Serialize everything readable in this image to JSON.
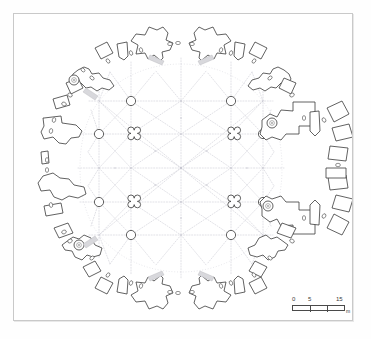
{
  "figure": {
    "type": "architectural-plan",
    "background_color": "#ffffff",
    "frame_color": "#c9c9c9"
  },
  "scale_bar": {
    "name": "scale-bar",
    "ticks": [
      "0",
      "5",
      "15"
    ],
    "unit": "m",
    "tick_positions_m": [
      0,
      5,
      15
    ],
    "bar_length_px": 53
  },
  "plan": {
    "ink_color": "#3a3a3a",
    "rib_color": "#b9b9c4",
    "grid_color": "#c6c6cf",
    "center": {
      "x": 181,
      "y": 168
    },
    "chamber_radius_x": 92,
    "chamber_radius_y": 102,
    "description": "Circular rock-cut hall ringed by radial niche chambers, internal dotted rib-vault pattern, grid of round and quatrefoil piers",
    "piers": {
      "round_label": "round-pier",
      "quatrefoil_label": "quatrefoil-pier",
      "round_positions": [
        [
          131,
          101
        ],
        [
          231,
          101
        ],
        [
          99,
          134
        ],
        [
          263,
          134
        ],
        [
          99,
          202
        ],
        [
          263,
          202
        ],
        [
          131,
          235
        ],
        [
          231,
          235
        ]
      ],
      "quatrefoil_positions": [
        [
          131,
          134
        ],
        [
          231,
          134
        ],
        [
          131,
          202
        ],
        [
          231,
          202
        ]
      ],
      "round_radius": 5,
      "quatrefoil_radius": 7
    },
    "survey_markers": {
      "label": "survey-marker",
      "positions": [
        [
          74,
          80
        ],
        [
          272,
          123
        ],
        [
          268,
          206
        ],
        [
          79,
          245
        ]
      ],
      "radius": 5
    },
    "niche_count": 24,
    "loculus_count": 40
  }
}
